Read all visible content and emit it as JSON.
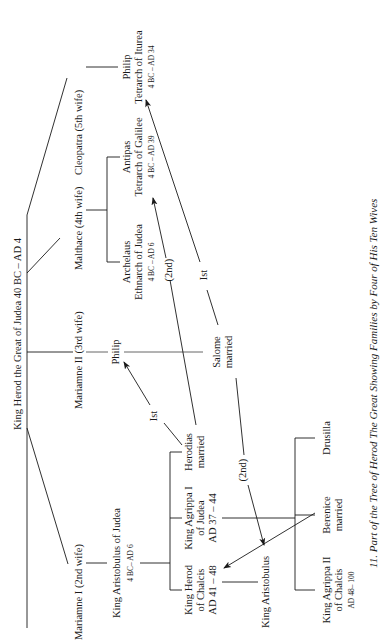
{
  "figure": {
    "caption": "11.  Part of the Tree of Herod The Great Showing Families by Four of His Ten Wives",
    "orientation": "rotated-90-ccw"
  },
  "root": {
    "name": "King Herod the Great of Judea 40 BC – AD 4"
  },
  "wives": [
    {
      "id": "cleopatra",
      "label": "Cleopatra (5th wife)"
    },
    {
      "id": "malthace",
      "label": "Malthace (4th wife)"
    },
    {
      "id": "mariamne2",
      "label": "Mariamne II (3rd wife)"
    },
    {
      "id": "mariamne1",
      "label": "Mariamne I (2nd wife)"
    }
  ],
  "children": {
    "philip_tetrarch": {
      "line1": "Philip",
      "line2": "Tetrarch of Iturea",
      "line3": "4 BC – AD 34"
    },
    "antipas": {
      "line1": "Antipas",
      "line2": "Tetrarch of Galilee",
      "line3": "4 BC – AD 39"
    },
    "archelaus": {
      "line1": "Archelaus",
      "line2": "Ethnarch of Judea",
      "line3": "4 BC – AD 6"
    },
    "philip": {
      "line1": "Philip"
    },
    "aristobulus": {
      "line1": "King Aristobulus of Judea",
      "line2": "4 BC– AD 6"
    }
  },
  "grandchildren": {
    "salome": {
      "line1": "Salome",
      "line2": "married"
    },
    "herodias": {
      "line1": "Herodias",
      "line2": "married"
    },
    "agrippa1": {
      "line1": "King Agrippa I",
      "line2": "of Judea",
      "line3": "AD 37 – 44"
    },
    "herod_chalcis": {
      "line1": "King Herod",
      "line2": "of Chalcis",
      "line3": "AD 41 – 48"
    }
  },
  "great_grandchildren": {
    "aristobulus_king": {
      "line1": "King Aristobulus"
    },
    "drusilla": {
      "line1": "Drusilla"
    },
    "berenice": {
      "line1": "Berenice",
      "line2": "married"
    },
    "agrippa2": {
      "line1": "King Agrippa II",
      "line2": "of Chalcis",
      "line3": "AD 48– 100"
    }
  },
  "marriage_labels": {
    "herodias_to_philip": "Ist",
    "herodias_to_antipas": "(2nd)",
    "salome_to_philip_tetrarch": "Ist",
    "salome_to_aristobulus": "(2nd)"
  }
}
